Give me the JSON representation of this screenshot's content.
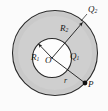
{
  "figure": {
    "colors": {
      "background": "#fbfbfb",
      "shell_fill": "#cfcfcf",
      "cavity_fill": "#fdfdfd",
      "stroke": "#1a1a1a"
    },
    "geometry": {
      "outer_circle": {
        "cx": 55,
        "cy": 53,
        "r": 43
      },
      "inner_circle": {
        "cx": 52,
        "cy": 58,
        "r": 20
      },
      "center_point": {
        "x": 52,
        "y": 58
      },
      "point_P": {
        "x": 85,
        "y": 83
      },
      "radius_vector_R1": {
        "x1": 52,
        "y1": 58,
        "x2": 38,
        "y2": 43
      },
      "radius_vector_R2": {
        "x1": 52,
        "y1": 58,
        "x2": 82,
        "y2": 23
      },
      "radius_vector_r": {
        "x1": 52,
        "y1": 58,
        "x2": 85,
        "y2": 83
      }
    },
    "labels": {
      "R1": {
        "base": "R",
        "sub": "1"
      },
      "O": {
        "base": "O",
        "sub": ""
      },
      "R2": {
        "base": "R",
        "sub": "2"
      },
      "Q1": {
        "base": "Q",
        "sub": "1"
      },
      "Q2": {
        "base": "Q",
        "sub": "2"
      },
      "r": {
        "base": "r",
        "sub": ""
      },
      "P": {
        "base": "P",
        "sub": ""
      }
    }
  }
}
